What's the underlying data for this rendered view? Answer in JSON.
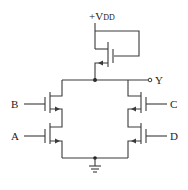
{
  "diagram": {
    "type": "cmos-circuit",
    "supply_label_main": "+V",
    "supply_label_sub": "DD",
    "output_label": "Y",
    "inputs": [
      {
        "name": "B",
        "side": "left",
        "position": "upper"
      },
      {
        "name": "A",
        "side": "left",
        "position": "lower"
      },
      {
        "name": "C",
        "side": "right",
        "position": "upper"
      },
      {
        "name": "D",
        "side": "right",
        "position": "lower"
      }
    ],
    "components": [
      {
        "id": "load",
        "kind": "depletion-load-transistor",
        "connection": "gate tied to source/output? drawn with gate loop to VDD"
      },
      {
        "id": "MB",
        "kind": "nmos",
        "gate": "B",
        "series_with": "MA"
      },
      {
        "id": "MA",
        "kind": "nmos",
        "gate": "A"
      },
      {
        "id": "MC",
        "kind": "nmos",
        "gate": "C",
        "series_with": "MD"
      },
      {
        "id": "MD",
        "kind": "nmos",
        "gate": "D"
      }
    ],
    "ground": "ground-symbol",
    "colors": {
      "line": "#3a3a3a",
      "background": "#ffffff"
    }
  }
}
